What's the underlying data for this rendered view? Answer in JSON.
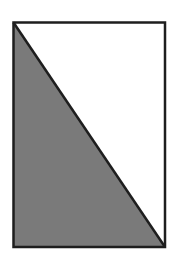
{
  "diagram": {
    "type": "rectangle-with-diagonal",
    "rectangle": {
      "x": 13.5,
      "y": 22.5,
      "width": 151.5,
      "height": 224.5
    },
    "diagonal": {
      "from": "top-left",
      "to": "bottom-right"
    },
    "shaded_region": "lower-left-triangle",
    "colors": {
      "stroke": "#1e1e1e",
      "shade": "#7a7a7a",
      "background": "#ffffff"
    },
    "stroke_width": 2.5
  }
}
